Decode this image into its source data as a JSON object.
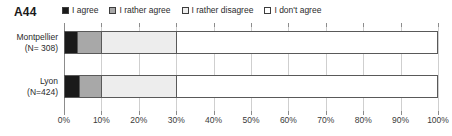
{
  "chart_data": {
    "type": "bar",
    "orientation": "horizontal",
    "stacked": true,
    "normalized": true,
    "title": "A44",
    "xlabel": "",
    "ylabel": "",
    "xlim": [
      0,
      100
    ],
    "grid": true,
    "legend_position": "top",
    "categories": [
      "Montpellier\n(N= 308)",
      "Lyon\n(N=424)"
    ],
    "category_labels": [
      {
        "name": "Montpellier",
        "n": "(N= 308)"
      },
      {
        "name": "Lyon",
        "n": "(N=424)"
      }
    ],
    "tick_values": [
      0,
      10,
      20,
      30,
      40,
      50,
      60,
      70,
      80,
      90,
      100
    ],
    "tick_labels": [
      "0%",
      "10%",
      "20%",
      "30%",
      "40%",
      "50%",
      "60%",
      "70%",
      "80%",
      "90%",
      "100%"
    ],
    "series": [
      {
        "name": "I agree",
        "color": "#1a1a1a",
        "values": [
          3.5,
          4
        ]
      },
      {
        "name": "I rather agree",
        "color": "#a8a8a8",
        "values": [
          6.5,
          6
        ]
      },
      {
        "name": "I rather disagree",
        "color": "#ededed",
        "values": [
          20,
          20
        ]
      },
      {
        "name": "I don't agree",
        "color": "#ffffff",
        "values": [
          70,
          70
        ]
      }
    ]
  },
  "legend": {
    "items": [
      {
        "label": "I agree",
        "swatch": "#1a1a1a"
      },
      {
        "label": "I rather agree",
        "swatch": "#a8a8a8"
      },
      {
        "label": "I rather disagree",
        "swatch": "#ededed"
      },
      {
        "label": "I don't agree",
        "swatch": "#ffffff"
      }
    ]
  },
  "colors": {
    "axis": "#8c8c8c",
    "grid": "#cfcfcf",
    "bar_border": "#595959",
    "text": "#2b2b2b",
    "background": "#ffffff"
  }
}
